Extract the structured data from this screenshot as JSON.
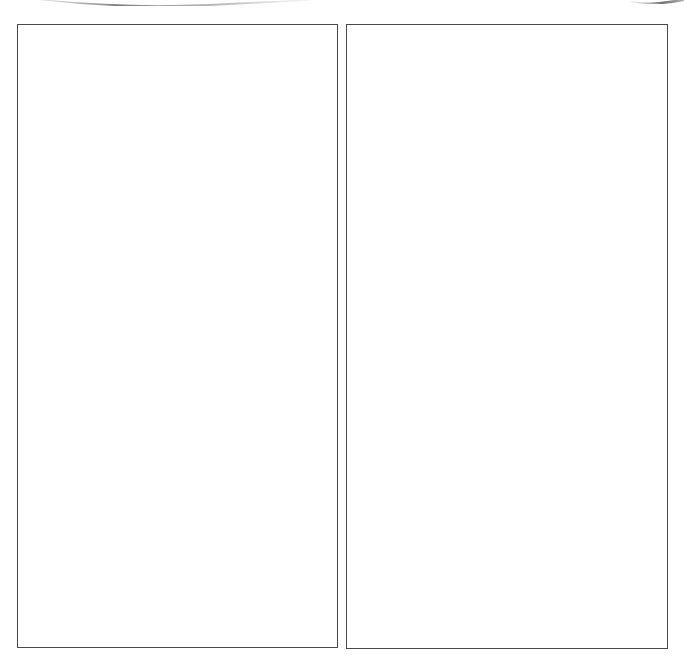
{
  "page": {
    "background": "#ffffff",
    "border_color": "#4a4a4a"
  },
  "decorations": {
    "top_left_swoosh": "swoosh-curve",
    "top_right_swoosh": "swoosh-curve"
  },
  "panels": [
    {
      "id": "left",
      "content": ""
    },
    {
      "id": "right",
      "content": ""
    }
  ]
}
